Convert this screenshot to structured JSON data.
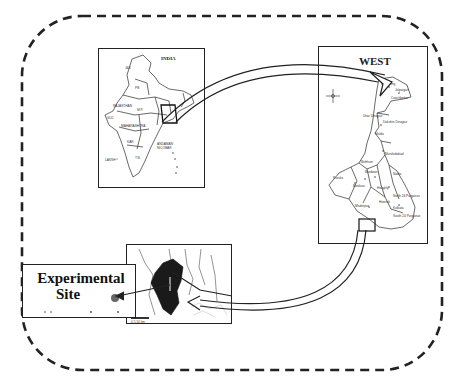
{
  "figure": {
    "type": "location_map",
    "colors": {
      "frame_dash": "#222222",
      "panel_border": "#222222",
      "map_line": "#444444",
      "site_fill": "#1a1a1a",
      "site_marker": "#666666",
      "background": "#ffffff"
    }
  },
  "panels": {
    "india": {
      "title": "INDIA",
      "labels": [
        "JAMMU & KASHMIR",
        "PUNJAB",
        "RAJASTHAN",
        "GUJARAT",
        "MADHYA PRADESH",
        "MAHARASHTRA",
        "KARNATAKA",
        "TAMIL NADU",
        "KERALA",
        "ANDAMAN & NICOBAR",
        "LAKSHADWEEP"
      ]
    },
    "west_bengal": {
      "title": "WEST",
      "districts": [
        "Darjeeling",
        "Jalpaiguri",
        "Coochbehar",
        "Uttar Dinajpur",
        "Dakshin Dinajpur",
        "Malda",
        "Murshidabad",
        "Birbhum",
        "Burdwan",
        "Purulia",
        "Bankura",
        "Nadia",
        "Hooghly",
        "North 24 Parganas",
        "Howrah",
        "Medinipur",
        "Kolkata",
        "South 24 Parganas"
      ]
    },
    "site_region": {
      "scale_label": "0 5 10 km"
    },
    "experimental_site": {
      "label_line1": "Experimental",
      "label_line2": "Site"
    }
  }
}
